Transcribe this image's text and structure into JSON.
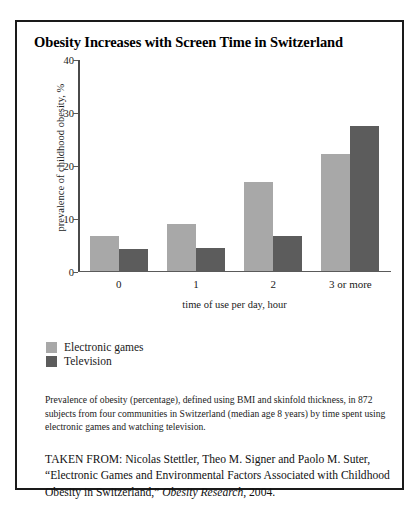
{
  "figure": {
    "title": "Obesity Increases with Screen Time in Switzerland",
    "caption": "Prevalence of obesity (percentage), defined using BMI and skinfold thickness, in 872 subjects from four communities in Switzerland (median age 8 years) by time spent using electronic games and watching television.",
    "source_prefix": "TAKEN FROM: Nicolas Stettler, Theo M. Signer and Paolo M. Suter, “Electronic Games and Environmental Factors Associated with Childhood Obesity in Switzerland,” ",
    "source_journal": "Obesity Research",
    "source_suffix": ", 2004."
  },
  "colors": {
    "electronic_games": "#a8a8a8",
    "television": "#5c5c5c",
    "frame": "#1a1a1a",
    "axis": "#5a5a5a"
  },
  "chart_data": {
    "type": "bar",
    "title": "Obesity Increases with Screen Time in Switzerland",
    "xlabel": "time of use per day, hour",
    "ylabel": "prevalence of childhood obesity, %",
    "categories": [
      "0",
      "1",
      "2",
      "3 or more"
    ],
    "series": [
      {
        "name": "Electronic games",
        "color": "#a8a8a8",
        "values": [
          6.5,
          8.8,
          16.7,
          22.0
        ]
      },
      {
        "name": "Television",
        "color": "#5c5c5c",
        "values": [
          4.0,
          4.3,
          6.5,
          27.3
        ]
      }
    ],
    "ylim": [
      0,
      40
    ],
    "yticks": [
      0,
      10,
      20,
      30,
      40
    ],
    "ytick_labels": [
      "0",
      "10",
      "20",
      "30",
      "40"
    ],
    "grid": false,
    "legend_position": "below-left"
  }
}
